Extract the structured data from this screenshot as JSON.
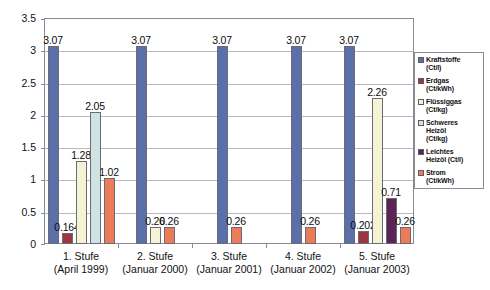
{
  "chart_data": {
    "type": "bar",
    "title": "",
    "xlabel": "",
    "ylabel": "",
    "ylim": [
      0,
      3.5
    ],
    "ytick_labels": [
      "0",
      "0.5",
      "1",
      "1.5",
      "2",
      "2.5",
      "3",
      "3.5"
    ],
    "ytick_values": [
      0,
      0.5,
      1,
      1.5,
      2,
      2.5,
      3,
      3.5
    ],
    "grid": true,
    "legend_position": "right",
    "categories": [
      "1. Stufe (April 1999)",
      "2. Stufe (Januar 2000)",
      "3. Stufe (Januar 2001)",
      "4. Stufe (Januar 2002)",
      "5. Stufe (Januar 2003)"
    ],
    "category_lines": [
      [
        "1. Stufe",
        "(April 1999)"
      ],
      [
        "2. Stufe",
        "(Januar 2000)"
      ],
      [
        "3. Stufe",
        "(Januar 2001)"
      ],
      [
        "4. Stufe",
        "(Januar 2002)"
      ],
      [
        "5. Stufe",
        "(Januar 2003)"
      ]
    ],
    "series": [
      {
        "name": "Kraftstoffe (Ct/l)",
        "color": "#5b6fa8",
        "values": [
          3.07,
          3.07,
          3.07,
          3.07,
          3.07
        ]
      },
      {
        "name": "Erdgas (Ct/kWh)",
        "color": "#9c3741",
        "values": [
          0.164,
          null,
          null,
          null,
          0.202
        ]
      },
      {
        "name": "Flüssiggas (Ct/kg)",
        "color": "#f4f4d4",
        "values": [
          1.28,
          0.26,
          null,
          null,
          2.26
        ]
      },
      {
        "name": "Schweres Heizöl (Ct/kg)",
        "color": "#cfe4e2",
        "values": [
          2.05,
          null,
          null,
          null,
          null
        ]
      },
      {
        "name": "Leichtes Heizöl (Ct/l)",
        "color": "#5c2355",
        "values": [
          null,
          null,
          null,
          null,
          0.71
        ]
      },
      {
        "name": "Strom (Ct/kWh)",
        "color": "#ec7b57",
        "values": [
          1.02,
          0.26,
          0.26,
          0.26,
          0.26
        ]
      }
    ],
    "data_labels": {
      "g1": [
        "3.07",
        "0.164",
        "1.28",
        "2.05",
        "1.02"
      ],
      "g2": [
        "3.07",
        "0.26",
        "0.26"
      ],
      "g3": [
        "3.07",
        "0.26"
      ],
      "g4": [
        "3.07",
        "0.26"
      ],
      "g5": [
        "3.07",
        "0.202",
        "2.26",
        "0.71",
        "0.26"
      ]
    }
  },
  "legend": {
    "items": [
      {
        "label_line1": "Kraftstoffe",
        "label_line2": "(Ct/l)",
        "color": "#5b6fa8",
        "swatch_name": "legend-swatch-kraftstoffe"
      },
      {
        "label_line1": "Erdgas",
        "label_line2": "(Ct/kWh)",
        "color": "#9c3741",
        "swatch_name": "legend-swatch-erdgas"
      },
      {
        "label_line1": "Flüssiggas",
        "label_line2": "(Ct/kg)",
        "color": "#f4f4d4",
        "swatch_name": "legend-swatch-fluessiggas"
      },
      {
        "label_line1": "Schweres",
        "label_line2": "Heizöl",
        "label_line3": "(Ct/kg)",
        "color": "#cfe4e2",
        "swatch_name": "legend-swatch-schweres-heizoel"
      },
      {
        "label_line1": "Leichtes",
        "label_line2": "Heizöl (Ct/l)",
        "color": "#5c2355",
        "swatch_name": "legend-swatch-leichtes-heizoel"
      },
      {
        "label_line1": "Strom",
        "label_line2": "(Ct/kWh)",
        "color": "#ec7b57",
        "swatch_name": "legend-swatch-strom"
      }
    ]
  }
}
